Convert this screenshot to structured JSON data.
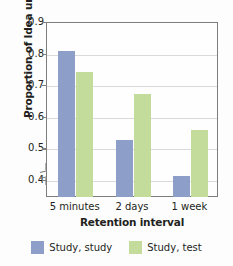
{
  "chart_data": {
    "type": "bar",
    "title": "",
    "xlabel": "Retention interval",
    "ylabel": "Proportion of Idea units recalled",
    "categories": [
      "5 minutes",
      "2 days",
      "1 week"
    ],
    "series": [
      {
        "name": "Study, study",
        "color": "#8d9fc9",
        "values": [
          0.81,
          0.53,
          0.415
        ]
      },
      {
        "name": "Study, test",
        "color": "#c4dc9b",
        "values": [
          0.745,
          0.675,
          0.56
        ]
      }
    ],
    "ylim": [
      0.4,
      0.9
    ],
    "yticks": [
      0.4,
      0.5,
      0.6,
      0.7,
      0.8,
      0.9
    ],
    "ytick_labels": [
      "0.4",
      "0.5",
      "0.6",
      "0.7",
      "0.8",
      "0.9"
    ],
    "axis_break": true,
    "grid": "horizontal",
    "legend_position": "bottom"
  },
  "legend": {
    "items": [
      {
        "label": "Study, study",
        "color": "#8d9fc9"
      },
      {
        "label": "Study, test",
        "color": "#c4dc9b"
      }
    ]
  },
  "colors": {
    "series_1": "#8d9fc9",
    "series_2": "#c4dc9b",
    "gridline": "#d8dade",
    "axis": "#7d7d7d",
    "text": "#231f20"
  }
}
